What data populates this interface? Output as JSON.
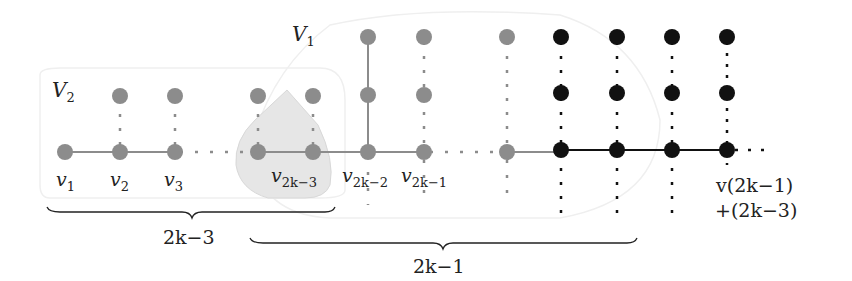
{
  "diagram": {
    "sets": [
      {
        "name": "V",
        "sub": "2"
      },
      {
        "name": "V",
        "sub": "1"
      }
    ],
    "vertex_labels": [
      {
        "base": "v",
        "sub": "1"
      },
      {
        "base": "v",
        "sub": "2"
      },
      {
        "base": "v",
        "sub": "3"
      },
      {
        "base": "v",
        "sub": "2k−3"
      },
      {
        "base": "v",
        "sub": "2k−2"
      },
      {
        "base": "v",
        "sub": "2k−1"
      }
    ],
    "last_vertex_label": {
      "line1": "v(2k−1)",
      "line2": "+(2k−3)"
    },
    "braces": [
      {
        "label": "2k−3"
      },
      {
        "label": "2k−1"
      }
    ],
    "colors": {
      "gray_vertex": "#8c8c8c",
      "black_vertex": "#111111",
      "highlight_fill": "#e6e6e6",
      "region_outline": "#efefef",
      "text": "#222222"
    }
  }
}
